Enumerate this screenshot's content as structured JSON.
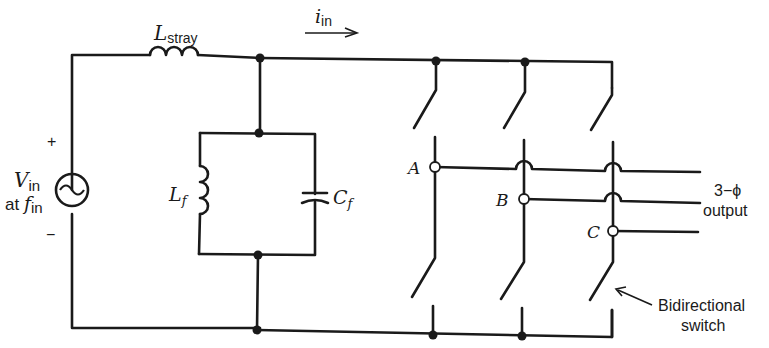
{
  "diagram": {
    "source": {
      "symbol": "V",
      "symbol_sub": "in",
      "line2_prefix": "at ",
      "line2_symbol": "f",
      "line2_sub": "in",
      "plus": "+",
      "minus": "−"
    },
    "stray_inductor": {
      "symbol": "L",
      "sub": "stray"
    },
    "current": {
      "symbol": "i",
      "sub": "in"
    },
    "filter_inductor": {
      "symbol": "L",
      "sub": "f"
    },
    "filter_capacitor": {
      "symbol": "C",
      "sub": "f"
    },
    "nodes": {
      "a": "A",
      "b": "B",
      "c": "C"
    },
    "output_label": {
      "line1": "3−ϕ",
      "line2": "output"
    },
    "switch_label": {
      "line1": "Bidirectional",
      "line2": "switch"
    }
  }
}
